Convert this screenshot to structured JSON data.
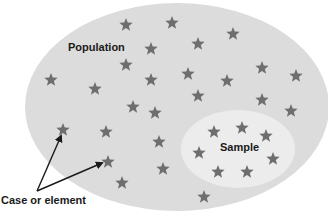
{
  "diagram": {
    "population_label": "Population",
    "sample_label": "Sample",
    "case_label": "Case or element",
    "colors": {
      "population_fill": "#dcdcdc",
      "sample_fill": "#ececec",
      "star": "#6e6e6e",
      "text": "#1a1a1a",
      "arrow": "#1a1a1a"
    },
    "population_ellipse": {
      "cx": 177,
      "cy": 107,
      "rx": 152,
      "ry": 104
    },
    "sample_ellipse": {
      "cx": 238,
      "cy": 149,
      "rx": 57,
      "ry": 39
    },
    "population_stars": [
      [
        126,
        25
      ],
      [
        172,
        23
      ],
      [
        233,
        34
      ],
      [
        198,
        44
      ],
      [
        151,
        49
      ],
      [
        126,
        65
      ],
      [
        51,
        80
      ],
      [
        95,
        89
      ],
      [
        151,
        80
      ],
      [
        188,
        74
      ],
      [
        227,
        81
      ],
      [
        262,
        68
      ],
      [
        296,
        76
      ],
      [
        198,
        96
      ],
      [
        262,
        100
      ],
      [
        291,
        111
      ],
      [
        133,
        107
      ],
      [
        155,
        113
      ],
      [
        63,
        130
      ],
      [
        106,
        132
      ],
      [
        159,
        142
      ],
      [
        108,
        162
      ],
      [
        163,
        169
      ],
      [
        122,
        183
      ],
      [
        204,
        197
      ]
    ],
    "sample_stars": [
      [
        214,
        132
      ],
      [
        242,
        128
      ],
      [
        266,
        136
      ],
      [
        199,
        153
      ],
      [
        273,
        159
      ],
      [
        218,
        172
      ],
      [
        247,
        172
      ]
    ],
    "arrows": [
      {
        "from": [
          37,
          191
        ],
        "to": [
          61,
          136
        ]
      },
      {
        "from": [
          37,
          191
        ],
        "to": [
          102,
          163
        ]
      }
    ]
  }
}
